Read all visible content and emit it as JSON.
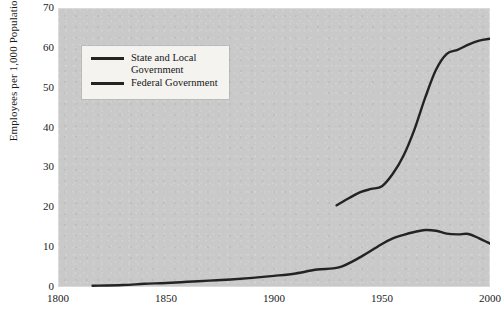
{
  "chart_data": {
    "type": "line",
    "title": "",
    "xlabel": "",
    "ylabel": "Employees per 1,000 Population",
    "xlim": [
      1800,
      2000
    ],
    "ylim": [
      0,
      70
    ],
    "xticks": [
      1800,
      1850,
      1900,
      1950,
      2000
    ],
    "yticks": [
      0,
      10,
      20,
      30,
      40,
      50,
      60,
      70
    ],
    "grid": false,
    "legend_position": "upper-left-inside",
    "series": [
      {
        "name": "State and Local Government",
        "color": "#232323",
        "points": [
          [
            1929,
            20.5
          ],
          [
            1935,
            22.4
          ],
          [
            1940,
            23.8
          ],
          [
            1945,
            24.6
          ],
          [
            1950,
            25.3
          ],
          [
            1955,
            28.4
          ],
          [
            1960,
            33.0
          ],
          [
            1965,
            39.5
          ],
          [
            1970,
            47.5
          ],
          [
            1975,
            54.5
          ],
          [
            1980,
            58.5
          ],
          [
            1985,
            59.5
          ],
          [
            1990,
            60.8
          ],
          [
            1995,
            61.8
          ],
          [
            2000,
            62.3
          ]
        ]
      },
      {
        "name": "Federal Government",
        "color": "#232323",
        "points": [
          [
            1816,
            0.3
          ],
          [
            1830,
            0.5
          ],
          [
            1840,
            0.8
          ],
          [
            1850,
            1.0
          ],
          [
            1860,
            1.3
          ],
          [
            1870,
            1.6
          ],
          [
            1880,
            1.9
          ],
          [
            1890,
            2.3
          ],
          [
            1900,
            2.8
          ],
          [
            1910,
            3.4
          ],
          [
            1920,
            4.4
          ],
          [
            1930,
            4.9
          ],
          [
            1940,
            7.5
          ],
          [
            1950,
            10.8
          ],
          [
            1955,
            12.2
          ],
          [
            1960,
            13.1
          ],
          [
            1965,
            13.8
          ],
          [
            1970,
            14.3
          ],
          [
            1975,
            14.1
          ],
          [
            1980,
            13.4
          ],
          [
            1985,
            13.2
          ],
          [
            1990,
            13.3
          ],
          [
            1995,
            12.2
          ],
          [
            2000,
            10.9
          ]
        ]
      }
    ]
  },
  "legend": {
    "items": [
      {
        "label": "State and Local\nGovernment"
      },
      {
        "label": "Federal Government"
      }
    ]
  }
}
